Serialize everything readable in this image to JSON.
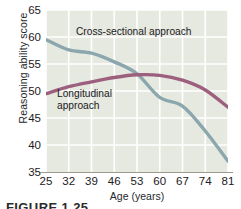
{
  "chart_data": {
    "type": "line",
    "title": "",
    "xlabel": "Age (years)",
    "ylabel": "Reasoning ability score",
    "xticklabels": [
      "25",
      "32",
      "39",
      "46",
      "53",
      "60",
      "67",
      "74",
      "81"
    ],
    "x": [
      25,
      32,
      39,
      46,
      53,
      60,
      67,
      74,
      81
    ],
    "yticklabels": [
      "65",
      "60",
      "55",
      "50",
      "45",
      "40",
      "35"
    ],
    "yticks": [
      65,
      60,
      55,
      50,
      45,
      40,
      35
    ],
    "ylim": [
      35,
      65
    ],
    "xlim": [
      25,
      81
    ],
    "grid": true,
    "legend_position": "inline-annotations",
    "panel_background": "#e5e9e0",
    "gridline_color": "#ffffff",
    "series": [
      {
        "name": "Cross-sectional approach",
        "color": "#8ba7ad",
        "values": [
          59.5,
          57.6,
          57.0,
          55.4,
          53.2,
          48.8,
          47.2,
          42.6,
          37.0
        ]
      },
      {
        "name": "Longitudinal approach",
        "color": "#9c5f7d",
        "values": [
          49.5,
          50.8,
          51.7,
          52.5,
          53.0,
          52.9,
          52.0,
          50.2,
          47.0
        ]
      }
    ],
    "annotations": [
      {
        "text": "Cross-sectional approach",
        "series": "Cross-sectional approach"
      },
      {
        "text": "Longitudinal\napproach",
        "series": "Longitudinal approach"
      }
    ]
  },
  "caption": {
    "text": "FIGURE 1.25"
  }
}
